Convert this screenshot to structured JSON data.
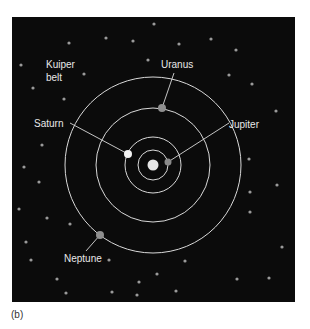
{
  "figure": {
    "caption": "(b)",
    "background": "#0b0b0b",
    "panel": {
      "x": 12,
      "y": 17,
      "width": 283,
      "height": 285
    },
    "sun": {
      "name": "Sun",
      "cx": 153,
      "cy": 165,
      "r": 5.5,
      "color": "#e6e6e6"
    },
    "orbits": [
      {
        "name": "Jupiter orbit",
        "r": 15
      },
      {
        "name": "Saturn orbit",
        "r": 28
      },
      {
        "name": "Uranus orbit",
        "r": 57
      },
      {
        "name": "Neptune orbit",
        "r": 88
      }
    ],
    "planets": [
      {
        "name": "Jupiter",
        "label": "Jupiter",
        "cx": 168,
        "cy": 162,
        "r": 3.5,
        "color": "#8a8a8a",
        "label_x": 229,
        "label_y": 128,
        "line": [
          168,
          162,
          229,
          123
        ]
      },
      {
        "name": "Saturn",
        "label": "Saturn",
        "cx": 128,
        "cy": 154,
        "r": 4,
        "color": "#f2f2f2",
        "label_x": 34,
        "label_y": 127,
        "line": [
          70,
          123,
          128,
          154
        ]
      },
      {
        "name": "Uranus",
        "label": "Uranus",
        "cx": 162,
        "cy": 108,
        "r": 4,
        "color": "#8f8f8f",
        "label_x": 161,
        "label_y": 68,
        "line": [
          174,
          73,
          162,
          108
        ]
      },
      {
        "name": "Neptune",
        "label": "Neptune",
        "cx": 100,
        "cy": 235,
        "r": 4,
        "color": "#8f8f8f",
        "label_x": 64,
        "label_y": 262,
        "line": [
          86,
          251,
          100,
          235
        ]
      }
    ],
    "region_label": {
      "line1": "Kuiper",
      "line2": "belt",
      "x": 46,
      "y1": 68,
      "y2": 81
    },
    "stars": [
      [
        21,
        65
      ],
      [
        69,
        43
      ],
      [
        106,
        38
      ],
      [
        133,
        41
      ],
      [
        148,
        60
      ],
      [
        84,
        74
      ],
      [
        33,
        88
      ],
      [
        64,
        99
      ],
      [
        42,
        145
      ],
      [
        154,
        24
      ],
      [
        179,
        44
      ],
      [
        211,
        39
      ],
      [
        236,
        50
      ],
      [
        229,
        75
      ],
      [
        252,
        84
      ],
      [
        276,
        111
      ],
      [
        249,
        159
      ],
      [
        24,
        167
      ],
      [
        39,
        182
      ],
      [
        19,
        209
      ],
      [
        47,
        218
      ],
      [
        70,
        224
      ],
      [
        26,
        242
      ],
      [
        31,
        260
      ],
      [
        109,
        260
      ],
      [
        57,
        279
      ],
      [
        66,
        293
      ],
      [
        112,
        292
      ],
      [
        139,
        282
      ],
      [
        137,
        295
      ],
      [
        277,
        185
      ],
      [
        250,
        192
      ],
      [
        250,
        212
      ],
      [
        282,
        247
      ],
      [
        185,
        261
      ],
      [
        157,
        274
      ],
      [
        176,
        291
      ],
      [
        237,
        279
      ],
      [
        269,
        278
      ]
    ],
    "star_color": "#9a9a9a",
    "orbit_color": "#d9d9d9",
    "line_color": "#d9d9d9"
  }
}
